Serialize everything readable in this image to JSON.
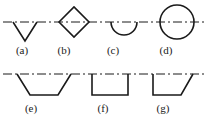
{
  "figure": {
    "background_color": "#ffffff",
    "line_color": "#1a1a1a",
    "centerline_style": "dash-dot",
    "stroke_width": 1.4,
    "rows": [
      {
        "centerline_y": 22,
        "items": [
          {
            "id": "a",
            "label": "(a)",
            "shape": "v-groove",
            "description": "V shaped notch opening upward, apex below the centerline",
            "label_x": 22,
            "points": "14,22 36,22 25,40 14,22",
            "path": "M 13 22 L 25 41 L 37 22"
          },
          {
            "id": "b",
            "label": "(b)",
            "shape": "diamond",
            "description": "Diamond (double-V) symmetric about the centerline",
            "label_x": 64,
            "path": "M 59 22 L 74 7 L 89 22 L 74 37 Z"
          },
          {
            "id": "c",
            "label": "(c)",
            "shape": "semicircle",
            "description": "Half circle below the centerline, U groove",
            "label_x": 113,
            "cx": 124,
            "cy": 22,
            "r": 13,
            "path": "M 111 22 A 13 13 0 0 0 137 22"
          },
          {
            "id": "d",
            "label": "(d)",
            "shape": "circle",
            "description": "Full circle centred on the centerline",
            "label_x": 166,
            "cx": 177,
            "cy": 22,
            "r": 17
          }
        ]
      },
      {
        "centerline_y": 74,
        "items": [
          {
            "id": "e",
            "label": "(e)",
            "shape": "trapezoid-symmetric",
            "description": "Symmetric trapezoid below the line, both sides slanted inward",
            "label_x": 31,
            "path": "M 17 74 L 30 95 L 58 95 L 71 74"
          },
          {
            "id": "f",
            "label": "(f)",
            "shape": "rectangle",
            "description": "Square U groove, both sides vertical",
            "label_x": 103,
            "path": "M 92 74 L 92 95 L 128 95 L 128 74"
          },
          {
            "id": "g",
            "label": "(g)",
            "shape": "trapezoid-asymmetric",
            "description": "Asymmetric trapezoid, left side vertical, right side slanted",
            "label_x": 163,
            "path": "M 153 74 L 153 95 L 181 95 L 193 74"
          }
        ]
      }
    ],
    "centerlines": [
      {
        "y": 22,
        "x1": 3,
        "x2": 206
      },
      {
        "y": 74,
        "x1": 3,
        "x2": 206
      }
    ]
  }
}
